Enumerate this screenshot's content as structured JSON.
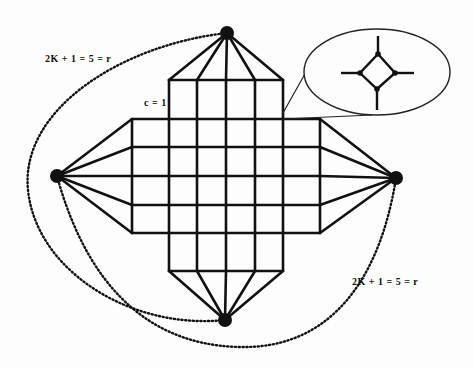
{
  "diagram": {
    "type": "cross-shaped grid graph with apex vertices",
    "colors": {
      "stroke": "#111111",
      "background": "#fdfdfd"
    },
    "labels": {
      "top_left_path": "2K + 1 = 5 = r",
      "bottom_right_path": "2K + 1 = 5 = r",
      "cell_size": "c = 1"
    },
    "grid": {
      "columns_x": [
        132,
        169,
        197,
        226,
        255,
        283,
        320
      ],
      "rows_y": [
        80,
        119,
        147,
        176,
        205,
        233,
        271
      ],
      "shape": "plus / cross"
    },
    "apex_vertices": [
      {
        "name": "top",
        "x": 227,
        "y": 33
      },
      {
        "name": "left",
        "x": 57,
        "y": 176
      },
      {
        "name": "right",
        "x": 396,
        "y": 178
      },
      {
        "name": "bottom",
        "x": 225,
        "y": 320
      }
    ],
    "inset": {
      "description": "magnified vertex replaced by diamond gadget",
      "ellipse": {
        "cx": 377,
        "cy": 72,
        "rx": 73,
        "ry": 43
      }
    }
  }
}
